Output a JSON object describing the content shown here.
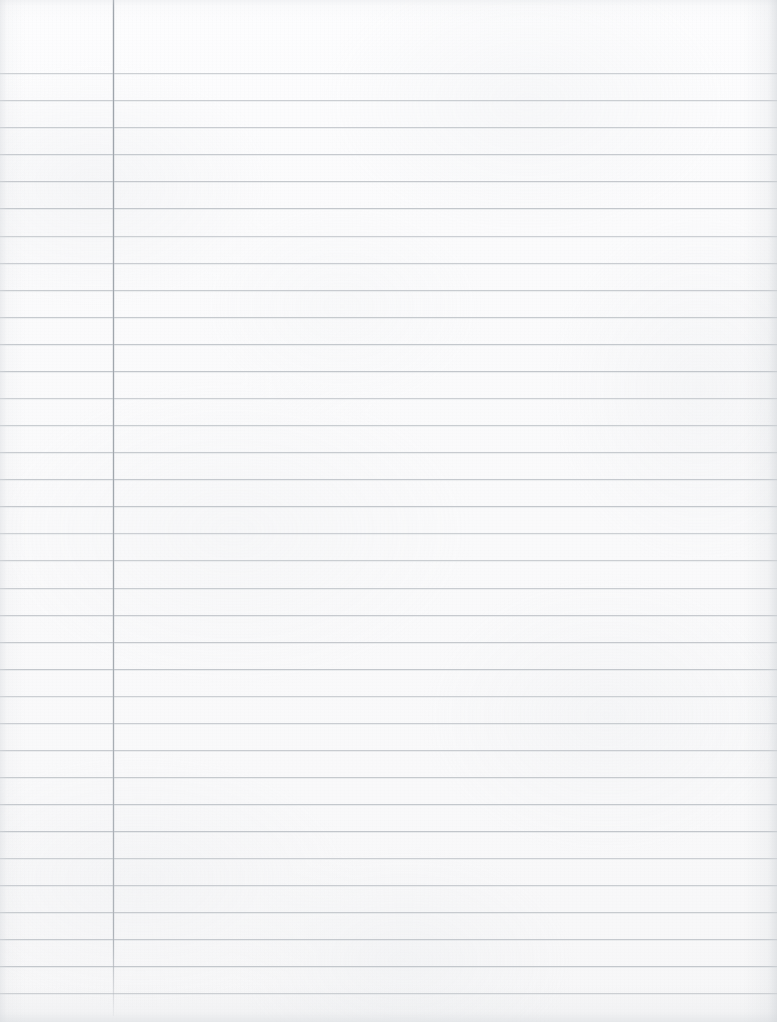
{
  "document": {
    "kind": "blank-ruled-notebook-page",
    "title": "Blank Ruled Notebook Paper",
    "content_text": "",
    "has_visible_text": false,
    "page_width": 777,
    "page_height": 1022
  },
  "paper": {
    "background_color": "#fbfbfc",
    "edge_shadow_color": "#d2d6da",
    "texture": "scanned-paper-mottle"
  },
  "ruling": {
    "style": "college-ruled-single-margin",
    "rule_color": "#c2c6cb",
    "rule_thickness_px": 1,
    "first_rule_y": 73,
    "rule_spacing_px": 27.06,
    "rule_count": 35,
    "rule_left_x": 0,
    "rule_right_x": 777,
    "rule_y_positions": [
      73,
      100,
      127,
      154,
      181,
      208,
      236,
      263,
      290,
      317,
      344,
      371,
      398,
      425,
      452,
      479,
      506,
      533,
      560,
      588,
      615,
      642,
      669,
      696,
      723,
      750,
      777,
      804,
      831,
      858,
      885,
      912,
      939,
      966,
      993
    ]
  },
  "margin_rule": {
    "name": "left-margin-line",
    "color": "#a2a8ae",
    "x": 113,
    "top_y": 0,
    "bottom_y": 1016,
    "thickness_px": 1,
    "orientation": "vertical"
  }
}
